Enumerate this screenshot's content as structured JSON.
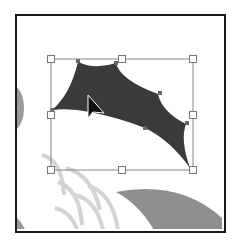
{
  "canvas": {
    "frame_color": "#1a1a1a",
    "background": "#ffffff"
  },
  "artwork": {
    "selected_shape": {
      "name": "dark-wing-shape",
      "fill": "#3a3a3a"
    },
    "background_shapes": [
      {
        "name": "left-gray-semicircle",
        "fill": "#9a9a9a"
      },
      {
        "name": "scale-arcs",
        "stroke": "#d0d0d0"
      },
      {
        "name": "bottom-gray-curve",
        "fill": "#8f8f8f"
      },
      {
        "name": "bottom-left-corner-shape",
        "fill": "#9a9a9a"
      }
    ]
  },
  "selection": {
    "bounding_box": {
      "left": 51,
      "top": 59,
      "right": 193,
      "bottom": 170,
      "stroke": "#888888"
    },
    "handles": [
      "top-left",
      "top-center",
      "top-right",
      "middle-left",
      "middle-right",
      "bottom-left",
      "bottom-center",
      "bottom-right"
    ]
  },
  "cursor": {
    "type": "arrow-pointer",
    "x": 88,
    "y": 96
  }
}
